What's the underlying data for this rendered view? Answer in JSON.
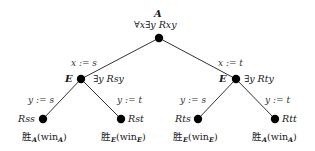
{
  "diagram": {
    "type": "game-tree",
    "root": {
      "player": "A",
      "formula": "∀x∃y Rxy"
    },
    "level1": [
      {
        "edge_label": "x := s",
        "player": "E",
        "formula": "∃y Rsy"
      },
      {
        "edge_label": "x := t",
        "player": "E",
        "formula": "∃y Rty"
      }
    ],
    "leaves": [
      {
        "edge_label": "y := s",
        "formula": "Rss",
        "winner_kanji": "胜",
        "winner_sub": "A",
        "win_text": "win",
        "win_sub": "A"
      },
      {
        "edge_label": "y := t",
        "formula": "Rst",
        "winner_kanji": "胜",
        "winner_sub": "E",
        "win_text": "win",
        "win_sub": "E"
      },
      {
        "edge_label": "y := s",
        "formula": "Rts",
        "winner_kanji": "胜",
        "winner_sub": "E",
        "win_text": "win",
        "win_sub": "E"
      },
      {
        "edge_label": "y := t",
        "formula": "Rtt",
        "winner_kanji": "胜",
        "winner_sub": "A",
        "win_text": "win",
        "win_sub": "A"
      }
    ],
    "colors": {
      "node": "#000000",
      "edge": "#333333",
      "text": "#1a1a1a"
    }
  }
}
